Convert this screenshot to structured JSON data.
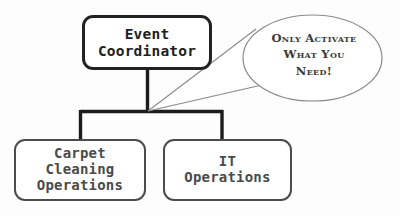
{
  "diagram": {
    "type": "org-chart",
    "background_color": "#fdfdfd",
    "root": {
      "id": "event-coordinator",
      "label": "Event\nCoordinator",
      "border_color": "#222222",
      "text_color": "#202020",
      "fill_color": "#ffffff"
    },
    "children": [
      {
        "id": "carpet-cleaning-operations",
        "label": "Carpet\nCleaning\nOperations",
        "border_color": "#4c4c4c",
        "text_color": "#4a4a4a",
        "fill_color": "#ffffff"
      },
      {
        "id": "it-operations",
        "label": "IT\nOperations",
        "border_color": "#4c4c4c",
        "text_color": "#4a4a4a",
        "fill_color": "#ffffff"
      }
    ],
    "callout": {
      "id": "only-activate-callout",
      "text": "Only Activate\nWhat You\nNeed!",
      "shape": "speech-bubble-ellipse",
      "outline_color": "#8a8a8a",
      "fill_color": "#ffffff",
      "text_color": "#3a3a3a",
      "tail_target": "connector-junction"
    },
    "connectors": {
      "line_color": "#1c1c1c",
      "junction_label": "connector-junction"
    }
  }
}
